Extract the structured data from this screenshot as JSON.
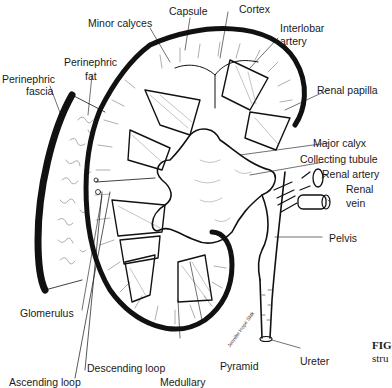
{
  "diagram": {
    "labels": {
      "capsule": "Capsule",
      "cortex": "Cortex",
      "minor_calyces": "Minor calyces",
      "interlobar_artery_1": "Interlobar",
      "interlobar_artery_2": "artery",
      "perinephric_fat_1": "Perinephric",
      "perinephric_fat_2": "fat",
      "perinephric_fascia_1": "Perinephric",
      "perinephric_fascia_2": "fascia",
      "renal_papilla": "Renal papilla",
      "major_calyx": "Major calyx",
      "collecting_tubule": "Collecting tubule",
      "renal_artery": "Renal artery",
      "renal_vein_1": "Renal",
      "renal_vein_2": "vein",
      "pelvis": "Pelvis",
      "glomerulus": "Glomerulus",
      "descending_loop": "Descending loop",
      "ascending_loop": "Ascending loop",
      "medullary": "Medullary",
      "pyramid": "Pyramid",
      "ureter": "Ureter"
    },
    "signature": "Jennifer Hope Slak",
    "caption": {
      "fig_prefix": "FIG",
      "line2": "stru"
    },
    "colors": {
      "ink": "#111111",
      "shading": "#777777",
      "background": "#ffffff"
    }
  }
}
